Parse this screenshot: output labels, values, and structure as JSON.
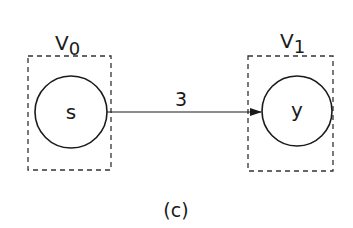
{
  "diagram": {
    "caption": "(c)",
    "groups": [
      {
        "id": "V0",
        "label": "V",
        "subscript": "0"
      },
      {
        "id": "V1",
        "label": "V",
        "subscript": "1"
      }
    ],
    "nodes": [
      {
        "id": "s",
        "label": "s",
        "group": "V0"
      },
      {
        "id": "y",
        "label": "y",
        "group": "V1"
      }
    ],
    "edges": [
      {
        "from": "s",
        "to": "y",
        "label": "3",
        "directed": true
      }
    ]
  }
}
